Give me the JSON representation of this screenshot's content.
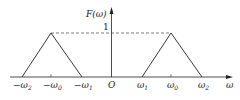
{
  "diagram": {
    "y_axis_label": "F(ω)",
    "x_axis_label": "ω",
    "origin_label": "O",
    "peak_value_label": "1",
    "x_ticks": [
      {
        "prefix": "−ω",
        "sub": "2"
      },
      {
        "prefix": "−ω",
        "sub": "0"
      },
      {
        "prefix": "−ω",
        "sub": "1"
      },
      {
        "prefix": "ω",
        "sub": "1"
      },
      {
        "prefix": "ω",
        "sub": "0"
      },
      {
        "prefix": "ω",
        "sub": "2"
      }
    ],
    "shapes": [
      {
        "type": "triangle",
        "points": [
          "−ω2",
          "−ω0",
          "−ω1"
        ],
        "peak": 1
      },
      {
        "type": "triangle",
        "points": [
          "ω1",
          "ω0",
          "ω2"
        ],
        "peak": 1
      }
    ],
    "line_color": "#222222"
  }
}
